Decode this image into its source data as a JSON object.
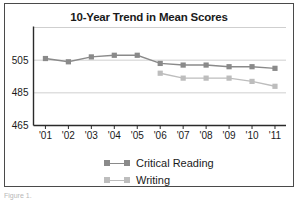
{
  "figure": {
    "caption": "Figure 1.",
    "frame_color": "#4a4a4a",
    "background": "#ffffff"
  },
  "legend": {
    "position": "bottom-center",
    "entries": [
      {
        "label": "Critical Reading",
        "color": "#8a8a8a",
        "marker": "square"
      },
      {
        "label": "Writing",
        "color": "#bdbdbd",
        "marker": "square"
      }
    ]
  },
  "chart_data": {
    "type": "line",
    "title": "10-Year Trend in Mean Scores",
    "xlabel": "",
    "ylabel": "",
    "grid": true,
    "grid_axis": "y",
    "legend_position": "bottom-center",
    "categories": [
      "'01",
      "'02",
      "'03",
      "'04",
      "'05",
      "'06",
      "'07",
      "'08",
      "'09",
      "'10",
      "'11"
    ],
    "x_tick_labels": [
      "'01",
      "'02",
      "'03",
      "'04",
      "'05",
      "'06",
      "'07",
      "'08",
      "'09",
      "'10",
      "'11"
    ],
    "y_tick_labels": [
      "465",
      "485",
      "505"
    ],
    "y_ticks": [
      465,
      485,
      505
    ],
    "ylim": [
      465,
      525
    ],
    "xlim_categories": [
      "'01",
      "'11"
    ],
    "series": [
      {
        "name": "Critical Reading",
        "color": "#8a8a8a",
        "marker": "square",
        "x": [
          "'01",
          "'02",
          "'03",
          "'04",
          "'05",
          "'06",
          "'07",
          "'08",
          "'09",
          "'10",
          "'11"
        ],
        "values": [
          506,
          504,
          507,
          508,
          508,
          503,
          502,
          502,
          501,
          501,
          500
        ]
      },
      {
        "name": "Writing",
        "color": "#bdbdbd",
        "marker": "square",
        "x": [
          "'06",
          "'07",
          "'08",
          "'09",
          "'10",
          "'11"
        ],
        "values": [
          497,
          494,
          494,
          494,
          492,
          489
        ]
      }
    ]
  }
}
